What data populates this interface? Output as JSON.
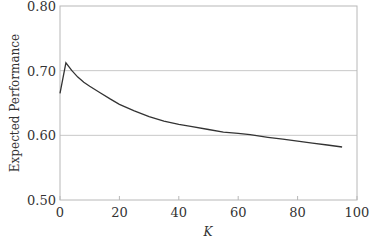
{
  "chart_data": {
    "type": "line",
    "title": "",
    "xlabel": "K",
    "ylabel": "Expected Performance",
    "xlim": [
      0,
      100
    ],
    "ylim": [
      0.5,
      0.8
    ],
    "x_ticks": [
      0,
      20,
      40,
      60,
      80,
      100
    ],
    "y_ticks": [
      "0.50",
      "0.60",
      "0.70",
      "0.80"
    ],
    "grid": {
      "horizontal": true,
      "vertical": false
    },
    "legend": null,
    "series": [
      {
        "name": "Expected Performance",
        "color": "#333333",
        "x": [
          0,
          2,
          4,
          6,
          8,
          10,
          13.5,
          17,
          20,
          25,
          30,
          35,
          40,
          44,
          50,
          55,
          60,
          64,
          70,
          75,
          80,
          85,
          90,
          95
        ],
        "y": [
          0.665,
          0.712,
          0.7,
          0.69,
          0.682,
          0.676,
          0.666,
          0.656,
          0.648,
          0.638,
          0.629,
          0.622,
          0.617,
          0.614,
          0.609,
          0.605,
          0.603,
          0.601,
          0.597,
          0.594,
          0.591,
          0.588,
          0.585,
          0.582
        ]
      }
    ]
  }
}
